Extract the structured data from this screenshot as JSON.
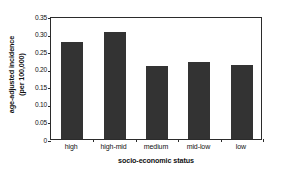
{
  "chart_data": {
    "type": "bar",
    "title": "",
    "subtitle": "",
    "xlabel": "socio-economic status",
    "ylabel": "age-adjusted incidence (per 100,000)",
    "ylabel_line1": "age-adjusted incidence",
    "ylabel_line2": "(per 100,000)",
    "categories": [
      "high",
      "high-mid",
      "medium",
      "mid-low",
      "low"
    ],
    "values": [
      0.275,
      0.305,
      0.207,
      0.22,
      0.211
    ],
    "series": [
      {
        "name": "age-adjusted incidence",
        "values": [
          0.275,
          0.305,
          0.207,
          0.22,
          0.211
        ]
      }
    ],
    "ylim": [
      0,
      0.35
    ],
    "xlim": [
      0,
      5
    ],
    "ytick_labels": [
      "0",
      "0.05",
      "0.10",
      "0.15",
      "0.20",
      "0.25",
      "0.30",
      "0.35"
    ],
    "ytick_values": [
      0,
      0.05,
      0.1,
      0.15,
      0.2,
      0.25,
      0.3,
      0.35
    ],
    "grid": false,
    "legend": false,
    "legend_position": "none",
    "bar_color": "#333333",
    "axis_color": "#2b2b2b",
    "background_color": "#ffffff"
  }
}
